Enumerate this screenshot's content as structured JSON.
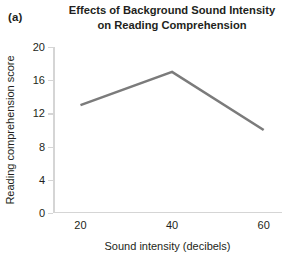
{
  "panel": {
    "label": "(a)"
  },
  "title": {
    "line1": "Effects of Background Sound Intensity",
    "line2": "on Reading Comprehension"
  },
  "chart_data": {
    "type": "line",
    "title": "Effects of Background Sound Intensity on Reading Comprehension",
    "xlabel": "Sound intensity (decibels)",
    "ylabel": "Reading comprehension score",
    "x": [
      20,
      40,
      60
    ],
    "values": [
      13,
      17,
      10
    ],
    "series": [
      {
        "name": "Reading comprehension score",
        "x": [
          20,
          40,
          60
        ],
        "values": [
          13,
          17,
          10
        ],
        "color": "#7b7b7b"
      }
    ],
    "xlim": [
      14,
      64
    ],
    "ylim": [
      0,
      20
    ],
    "xticks": [
      20,
      40,
      60
    ],
    "xticklabels": [
      "20",
      "40",
      "60"
    ],
    "yticks": [
      0,
      4,
      8,
      12,
      16,
      20
    ],
    "yticklabels": [
      "0",
      "4",
      "8",
      "12",
      "16",
      "20"
    ],
    "grid": false,
    "legend": false,
    "legend_position": "none",
    "line_color": "#7b7b7b",
    "axis_color": "#d5d5d5",
    "background_color": "#ffffff",
    "markers": false
  }
}
